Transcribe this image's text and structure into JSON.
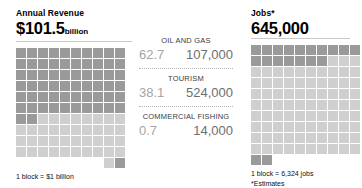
{
  "chart_data": {
    "type": "bar",
    "categories": [
      "Oil and Gas",
      "Tourism",
      "Commercial Fishing"
    ],
    "series": [
      {
        "name": "Annual Revenue ($ billion)",
        "values": [
          62.7,
          38.1,
          0.7
        ],
        "total": 101.5,
        "unit": "billion",
        "block_value": 1,
        "block_unit": "$1 billion",
        "blocks_total": 101.5
      },
      {
        "name": "Jobs",
        "values": [
          107000,
          524000,
          14000
        ],
        "total": 645000,
        "unit": "jobs",
        "block_value": 6324,
        "block_unit": "6,324 jobs",
        "blocks_total": 102
      }
    ],
    "legend_position": "below",
    "grid": false,
    "note": "*Estimates"
  },
  "left_panel": {
    "title": "Annual Revenue",
    "value": "$101.5",
    "unit": "billion",
    "legend": "1 block = $1 billion",
    "grid": {
      "columns": 10,
      "rows": 10,
      "dark_blocks": 62,
      "light_blocks": 38,
      "partial_light_blocks": 1,
      "partial_dark_blocks": 1,
      "colors": {
        "dark": "#9a9a9a",
        "light": "#cfcfcf"
      }
    }
  },
  "sectors": [
    {
      "name": "OIL AND GAS",
      "revenue": "62.7",
      "jobs": "107,000"
    },
    {
      "name": "TOURISM",
      "revenue": "38.1",
      "jobs": "524,000"
    },
    {
      "name": "COMMERCIAL FISHING",
      "revenue": "0.7",
      "jobs": "14,000"
    }
  ],
  "right_panel": {
    "title": "Jobs*",
    "value": "645,000",
    "legend": "1 block = 6,324 jobs",
    "note": "*Estimates",
    "grid": {
      "columns": 10,
      "rows": 10,
      "dark_blocks": 17,
      "light_blocks": 83,
      "partial_dark_blocks": 2,
      "colors": {
        "dark": "#9a9a9a",
        "light": "#cfcfcf"
      }
    }
  }
}
